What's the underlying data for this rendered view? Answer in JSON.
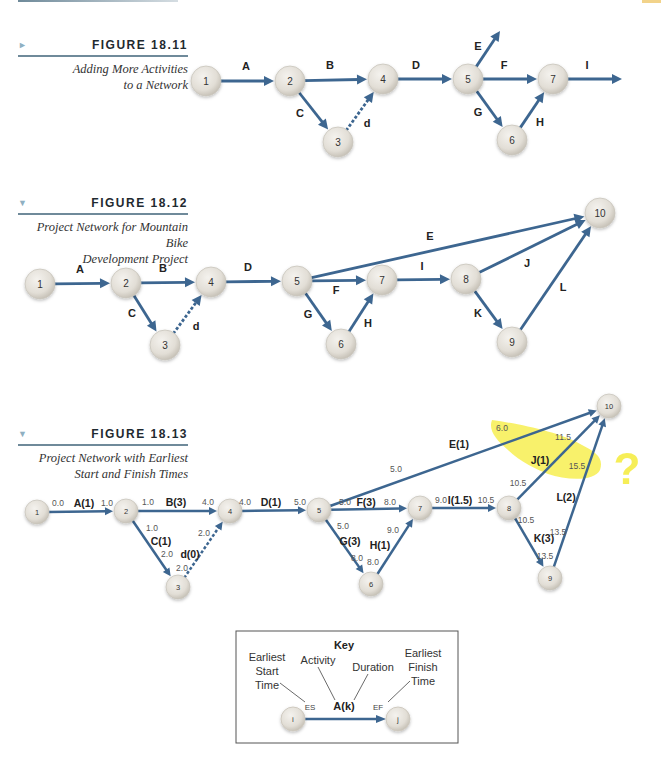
{
  "colors": {
    "arrow": "#3d6690",
    "node_fill": "#e4e1da",
    "node_stroke": "#c9c5bc",
    "highlight": "#f5ec3a",
    "rule": "#6f8a9a",
    "text": "#222222",
    "time_text": "#555555"
  },
  "figures": [
    {
      "id": "18.11",
      "number": "FIGURE 18.11",
      "caption_lines": [
        "Adding More Activities",
        "to a Network"
      ],
      "marker": "►"
    },
    {
      "id": "18.12",
      "number": "FIGURE 18.12",
      "caption_lines": [
        "Project Network for Mountain Bike",
        "Development Project"
      ],
      "marker": "▼"
    },
    {
      "id": "18.13",
      "number": "FIGURE 18.13",
      "caption_lines": [
        "Project Network with Earliest",
        "Start and Finish Times"
      ],
      "marker": "▼"
    }
  ],
  "fig11": {
    "nodes": [
      {
        "id": "1",
        "x": 206,
        "y": 81
      },
      {
        "id": "2",
        "x": 290,
        "y": 81
      },
      {
        "id": "4",
        "x": 383,
        "y": 79
      },
      {
        "id": "5",
        "x": 468,
        "y": 79
      },
      {
        "id": "7",
        "x": 553,
        "y": 79
      },
      {
        "id": "3",
        "x": 338,
        "y": 142
      },
      {
        "id": "6",
        "x": 512,
        "y": 140
      }
    ],
    "edges": [
      {
        "from": "1",
        "to": "2",
        "label": "A",
        "lx": 246,
        "ly": 70
      },
      {
        "from": "2",
        "to": "4",
        "label": "B",
        "lx": 330,
        "ly": 69
      },
      {
        "from": "2",
        "to": "3",
        "label": "C",
        "lx": 300,
        "ly": 117
      },
      {
        "from": "3",
        "to": "4",
        "label": "d",
        "lx": 367,
        "ly": 127,
        "dashed": true
      },
      {
        "from": "4",
        "to": "5",
        "label": "D",
        "lx": 416,
        "ly": 69
      },
      {
        "from": "5",
        "to": "7",
        "label": "F",
        "lx": 504,
        "ly": 69
      },
      {
        "from": "5",
        "to": "6",
        "label": "G",
        "lx": 478,
        "ly": 116
      },
      {
        "from": "6",
        "to": "7",
        "label": "H",
        "lx": 540,
        "ly": 126
      },
      {
        "from": "5",
        "toPoint": [
          500,
          31
        ],
        "label": "E",
        "lx": 478,
        "ly": 50
      },
      {
        "from": "7",
        "toPoint": [
          622,
          79
        ],
        "label": "I",
        "lx": 587,
        "ly": 69
      }
    ]
  },
  "fig12": {
    "nodes": [
      {
        "id": "1",
        "x": 40,
        "y": 284
      },
      {
        "id": "2",
        "x": 126,
        "y": 283
      },
      {
        "id": "4",
        "x": 211,
        "y": 282
      },
      {
        "id": "5",
        "x": 297,
        "y": 281
      },
      {
        "id": "7",
        "x": 382,
        "y": 280
      },
      {
        "id": "8",
        "x": 466,
        "y": 279
      },
      {
        "id": "3",
        "x": 165,
        "y": 345
      },
      {
        "id": "6",
        "x": 341,
        "y": 344
      },
      {
        "id": "9",
        "x": 512,
        "y": 342
      },
      {
        "id": "10",
        "x": 600,
        "y": 213
      }
    ],
    "edges": [
      {
        "from": "1",
        "to": "2",
        "label": "A",
        "lx": 80,
        "ly": 273
      },
      {
        "from": "2",
        "to": "4",
        "label": "B",
        "lx": 163,
        "ly": 272
      },
      {
        "from": "2",
        "to": "3",
        "label": "C",
        "lx": 132,
        "ly": 317
      },
      {
        "from": "3",
        "to": "4",
        "label": "d",
        "lx": 196,
        "ly": 330,
        "dashed": true
      },
      {
        "from": "4",
        "to": "5",
        "label": "D",
        "lx": 248,
        "ly": 271
      },
      {
        "from": "5",
        "to": "7",
        "label": "F",
        "lx": 336,
        "ly": 294
      },
      {
        "from": "5",
        "to": "6",
        "label": "G",
        "lx": 308,
        "ly": 318
      },
      {
        "from": "6",
        "to": "7",
        "label": "H",
        "lx": 368,
        "ly": 327
      },
      {
        "from": "5",
        "to": "10",
        "label": "E",
        "lx": 430,
        "ly": 240
      },
      {
        "from": "7",
        "to": "8",
        "label": "I",
        "lx": 422,
        "ly": 270
      },
      {
        "from": "8",
        "to": "10",
        "label": "J",
        "lx": 527,
        "ly": 267
      },
      {
        "from": "8",
        "to": "9",
        "label": "K",
        "lx": 478,
        "ly": 317
      },
      {
        "from": "9",
        "to": "10",
        "label": "L",
        "lx": 563,
        "ly": 291
      }
    ]
  },
  "fig13": {
    "nodes": [
      {
        "id": "1",
        "x": 37,
        "y": 512
      },
      {
        "id": "2",
        "x": 126,
        "y": 511
      },
      {
        "id": "4",
        "x": 230,
        "y": 511
      },
      {
        "id": "5",
        "x": 319,
        "y": 510
      },
      {
        "id": "7",
        "x": 420,
        "y": 508
      },
      {
        "id": "8",
        "x": 509,
        "y": 508
      },
      {
        "id": "3",
        "x": 178,
        "y": 587
      },
      {
        "id": "6",
        "x": 371,
        "y": 584
      },
      {
        "id": "9",
        "x": 550,
        "y": 578
      },
      {
        "id": "10",
        "x": 609,
        "y": 406
      }
    ],
    "edges": [
      {
        "from": "1",
        "to": "2",
        "label": "A(1)",
        "lx": 84,
        "ly": 507,
        "es": "0.0",
        "esx": 58,
        "esy": 506,
        "ef": "1.0",
        "efx": 107,
        "efy": 506
      },
      {
        "from": "2",
        "to": "4",
        "label": "B(3)",
        "lx": 176,
        "ly": 506,
        "es": "1.0",
        "esx": 148,
        "esy": 505,
        "ef": "4.0",
        "efx": 208,
        "efy": 505
      },
      {
        "from": "2",
        "to": "3",
        "label": "C(1)",
        "lx": 161,
        "ly": 545,
        "es": "1.0",
        "esx": 152,
        "esy": 531,
        "ef": "2.0",
        "efx": 167,
        "efy": 557
      },
      {
        "from": "3",
        "to": "4",
        "label": "d(0)",
        "lx": 190,
        "ly": 558,
        "es": "2.0",
        "esx": 182,
        "esy": 571,
        "ef": "2.0",
        "efx": 204,
        "efy": 536,
        "dashed": true
      },
      {
        "from": "4",
        "to": "5",
        "label": "D(1)",
        "lx": 271,
        "ly": 506,
        "es": "4.0",
        "esx": 245,
        "esy": 505,
        "ef": "5.0",
        "efx": 300,
        "efy": 505
      },
      {
        "from": "5",
        "to": "7",
        "label": "F(3)",
        "lx": 366,
        "ly": 506,
        "es": "5.0",
        "esx": 345,
        "esy": 505,
        "ef": "8.0",
        "efx": 390,
        "efy": 505
      },
      {
        "from": "5",
        "to": "6",
        "label": "G(3)",
        "lx": 350,
        "ly": 545,
        "es": "5.0",
        "esx": 343,
        "esy": 529,
        "ef": "8.0",
        "efx": 357,
        "efy": 561
      },
      {
        "from": "6",
        "to": "7",
        "label": "H(1)",
        "lx": 380,
        "ly": 549,
        "es": "8.0",
        "esx": 373,
        "esy": 565,
        "ef": "9.0",
        "efx": 393,
        "efy": 533
      },
      {
        "from": "5",
        "to": "10",
        "label": "E(1)",
        "lx": 459,
        "ly": 448,
        "es": "5.0",
        "esx": 396,
        "esy": 472,
        "ef": "6.0",
        "efx": 502,
        "efy": 431
      },
      {
        "from": "7",
        "to": "8",
        "label": "I(1.5)",
        "lx": 460,
        "ly": 504,
        "es": "9.0",
        "esx": 441,
        "esy": 503,
        "ef": "10.5",
        "efx": 486,
        "efy": 503
      },
      {
        "from": "8",
        "to": "10",
        "label": "J(1)",
        "lx": 540,
        "ly": 464,
        "es": "10.5",
        "esx": 518,
        "esy": 486,
        "ef": "11.5",
        "efx": 563,
        "efy": 440
      },
      {
        "from": "8",
        "to": "9",
        "label": "K(3)",
        "lx": 544,
        "ly": 542,
        "es": "10.5",
        "esx": 526,
        "esy": 523,
        "ef": "13.5",
        "efx": 545,
        "efy": 559
      },
      {
        "from": "9",
        "to": "10",
        "label": "L(2)",
        "lx": 566,
        "ly": 501,
        "es": "13.5",
        "esx": 558,
        "esy": 535,
        "ef": "15.5",
        "efx": 577,
        "efy": 469
      }
    ],
    "annotation": {
      "mark": "?",
      "x": 627,
      "y": 484
    }
  },
  "key": {
    "title": "Key",
    "es_label_lines": [
      "Earliest",
      "Start",
      "Time"
    ],
    "activity_label": "Activity",
    "duration_label": "Duration",
    "ef_label_lines": [
      "Earliest",
      "Finish",
      "Time"
    ],
    "es": "ES",
    "activity": "A(k)",
    "ef": "EF",
    "node_i": "i",
    "node_j": "j"
  }
}
